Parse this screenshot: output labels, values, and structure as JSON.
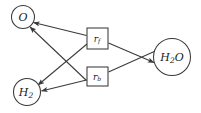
{
  "figure": {
    "background_color": "#ffffff",
    "stroke_color": "#3a3a3a",
    "text_color": "#1a1a1a",
    "width": 201,
    "height": 113
  },
  "species_nodes": [
    {
      "id": "O",
      "label_main": "O",
      "label_sub": "",
      "shape": "circle",
      "cx": 23,
      "cy": 17,
      "r": 11.5
    },
    {
      "id": "H2",
      "label_main": "H",
      "label_sub": "2",
      "shape": "circle",
      "cx": 27,
      "cy": 92,
      "r": 13.5
    },
    {
      "id": "H2O",
      "label_main_a": "H",
      "label_sub": "2",
      "label_main_b": "O",
      "shape": "circle",
      "cx": 172,
      "cy": 57,
      "r": 18.5
    }
  ],
  "rate_nodes": [
    {
      "id": "rf",
      "label_main": "r",
      "label_sub": "f",
      "shape": "square",
      "x": 87,
      "y": 28,
      "w": 21,
      "h": 21,
      "description": "forward reaction rate"
    },
    {
      "id": "rb",
      "label_main": "r",
      "label_sub": "b",
      "shape": "square",
      "x": 87,
      "y": 67,
      "w": 21,
      "h": 19,
      "description": "backward reaction rate"
    }
  ],
  "edges": [
    {
      "id": "o-to-rf",
      "from": "O",
      "to": "rf",
      "arrow_at": "from",
      "label": "O reactant of forward rate"
    },
    {
      "id": "h2-to-rf",
      "from": "H2",
      "to": "rf",
      "arrow_at": "from",
      "label": "H2 reactant of forward rate"
    },
    {
      "id": "rf-to-h2o",
      "from": "rf",
      "to": "H2O",
      "arrow_at": "to",
      "label": "forward rate produces H2O"
    },
    {
      "id": "h2o-to-rb",
      "from": "H2O",
      "to": "rb",
      "arrow_at": "none",
      "label": "H2O reactant of backward rate"
    },
    {
      "id": "rb-to-o",
      "from": "rb",
      "to": "O",
      "arrow_at": "to",
      "label": "backward rate produces O"
    },
    {
      "id": "rb-to-h2",
      "from": "rb",
      "to": "H2",
      "arrow_at": "to",
      "label": "backward rate produces H2"
    }
  ]
}
